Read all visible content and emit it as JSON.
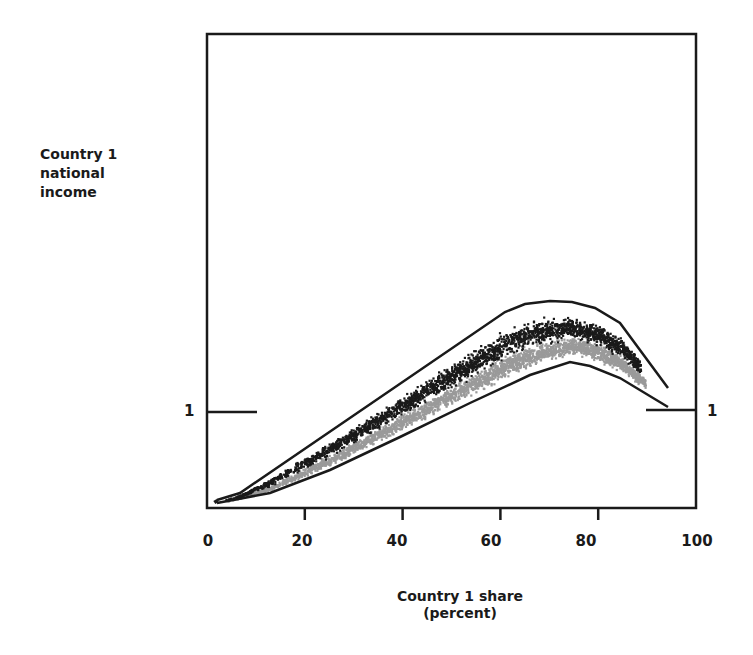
{
  "chart_data": {
    "type": "scatter",
    "title": "",
    "ylabel_lines": [
      "Country 1",
      "national",
      "income"
    ],
    "xlabel_lines": [
      "Country 1 share",
      "(percent)"
    ],
    "x_ticks": [
      "0",
      "20",
      "40",
      "60",
      "80",
      "100"
    ],
    "x_tick_values": [
      0,
      20,
      40,
      60,
      80,
      100
    ],
    "xlim": [
      0,
      100
    ],
    "y_reference": {
      "label": "1",
      "value": 1
    },
    "grid": false,
    "legend": null,
    "series": [
      {
        "name": "dark points (upper cloud)",
        "color": "#1a1a1a",
        "description": "Dense scatter from x~5 to x~92, peaking near x~65-70"
      },
      {
        "name": "gray points (lower cloud)",
        "color": "#9a9a9a",
        "description": "Scatter just below the dark cloud, peaking near x~70-75"
      }
    ],
    "upper_envelope": {
      "x": [
        2,
        7,
        62,
        67,
        72,
        77,
        82,
        87,
        97
      ],
      "y_rel": [
        0.85,
        0.87,
        1.22,
        1.24,
        1.245,
        1.243,
        1.23,
        1.2,
        1.05
      ]
    },
    "lower_envelope": {
      "x": [
        2,
        13,
        26,
        40,
        55,
        68,
        76,
        80,
        87,
        97
      ],
      "y_rel": [
        0.84,
        0.86,
        0.9,
        0.97,
        1.03,
        1.08,
        1.1,
        1.09,
        1.07,
        1.0
      ]
    }
  }
}
